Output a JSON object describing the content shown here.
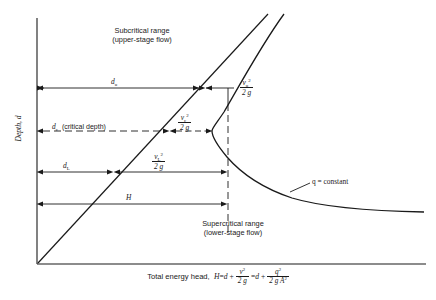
{
  "figure": {
    "type": "specific-energy-diagram",
    "axis": {
      "y_title": "Depth, d",
      "x_title_prefix": "Total energy head,"
    },
    "regions": {
      "subcritical_line1": "Subcritical range",
      "subcritical_line2": "(upper-stage flow)",
      "supercritical_line1": "Supercritical range",
      "supercritical_line2": "(lower-stage flow)"
    },
    "curve_label": "q = constant",
    "dimensions": [
      {
        "name": "depth-upper",
        "symbol": "d",
        "subscript": "u"
      },
      {
        "name": "critical-depth",
        "symbol": "d",
        "subscript": "c",
        "note": "(critical depth)"
      },
      {
        "name": "depth-lower",
        "symbol": "d",
        "subscript": "L"
      },
      {
        "name": "total-head",
        "symbol": "H",
        "subscript": ""
      }
    ],
    "velocity_heads": [
      {
        "name": "velocity-head-upper",
        "numerator_var": "v",
        "numerator_sub": "u",
        "numerator_exp": "2",
        "denominator": "2 g"
      },
      {
        "name": "velocity-head-critical",
        "numerator_var": "v",
        "numerator_sub": "c",
        "numerator_exp": "2",
        "denominator": "2 g"
      },
      {
        "name": "velocity-head-lower",
        "numerator_var": "v",
        "numerator_sub": "L",
        "numerator_exp": "2",
        "denominator": "2 g"
      }
    ],
    "equation": {
      "lead": "Total energy head,",
      "lhs": "H",
      "eq1": "=",
      "term_d1": "d",
      "plus1": "+",
      "frac1_num_var": "v",
      "frac1_num_exp": "2",
      "frac1_den": "2 g",
      "eq2": "=",
      "term_d2": "d",
      "plus2": "+",
      "frac2_num_var": "q",
      "frac2_num_exp": "2",
      "frac2_den_pre": "2 g A",
      "frac2_den_exp": "2"
    }
  },
  "colors": {
    "ink": "#1a1a1a",
    "background": "#ffffff"
  }
}
